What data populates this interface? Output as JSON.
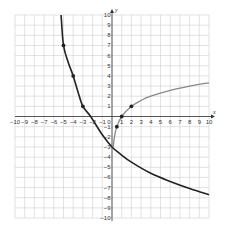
{
  "chart_data": {
    "type": "line",
    "title": "",
    "xlabel": "x",
    "ylabel": "y",
    "xlim": [
      -10,
      10
    ],
    "ylim": [
      -10,
      10
    ],
    "grid": true,
    "x_ticks": [
      -10,
      -9,
      -8,
      -7,
      -6,
      -5,
      -4,
      -3,
      -2,
      -1,
      0,
      1,
      2,
      3,
      4,
      5,
      6,
      7,
      8,
      9,
      10
    ],
    "y_ticks": [
      -10,
      -9,
      -8,
      -7,
      -6,
      -5,
      -4,
      -3,
      -2,
      -1,
      1,
      2,
      3,
      4,
      5,
      6,
      7,
      8,
      9,
      10
    ],
    "series": [
      {
        "name": "dark curve",
        "color": "#222222",
        "points": [
          [
            -5.25,
            10
          ],
          [
            -5,
            7
          ],
          [
            -4.5,
            5.3
          ],
          [
            -4,
            4
          ],
          [
            -3.5,
            2.4
          ],
          [
            -3,
            1
          ],
          [
            -2.2,
            0
          ],
          [
            -1,
            -1.8
          ],
          [
            0,
            -3
          ],
          [
            1,
            -3.8
          ],
          [
            2,
            -4.5
          ],
          [
            4,
            -5.6
          ],
          [
            6,
            -6.4
          ],
          [
            8,
            -7.1
          ],
          [
            10,
            -7.7
          ]
        ],
        "marked_points": [
          [
            -5,
            7
          ],
          [
            -4,
            4
          ],
          [
            -3,
            1
          ]
        ]
      },
      {
        "name": "gray curve",
        "color": "#888888",
        "points": [
          [
            0.125,
            -3
          ],
          [
            0.25,
            -2
          ],
          [
            0.5,
            -1
          ],
          [
            1,
            0
          ],
          [
            2,
            1
          ],
          [
            3,
            1.58
          ],
          [
            4,
            2
          ],
          [
            6,
            2.58
          ],
          [
            8,
            3
          ],
          [
            10,
            3.32
          ]
        ],
        "marked_points": [
          [
            0.5,
            -1
          ],
          [
            1,
            0
          ],
          [
            2,
            1
          ]
        ]
      }
    ]
  },
  "labels": {
    "x_axis": "x",
    "y_axis": "y",
    "origin": "0"
  }
}
